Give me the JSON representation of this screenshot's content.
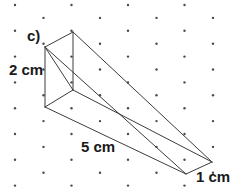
{
  "figure": {
    "kind": "isometric-dot-grid-wedge-prism",
    "labels": {
      "part": "c)",
      "height": "2 cm",
      "length": "5 cm",
      "depth": "1 cm"
    },
    "colors": {
      "line": "#3c3c3c",
      "dot": "#4a4a4a",
      "background": "#ffffff",
      "text": "#1a1a1a"
    },
    "grid": {
      "type": "isometric-staggered",
      "dot_radius": 1.2,
      "row_spacing": 12.9,
      "col_spacing": 56.5,
      "even_row_x_start": 15,
      "odd_row_x_start": 43.5,
      "rows": 15,
      "cols": 5
    },
    "vertices": {
      "front_top_left": [
        45,
        47
      ],
      "front_bottom_left": [
        45,
        107
      ],
      "back_top": [
        73,
        32
      ],
      "back_bottom": [
        73,
        90
      ],
      "right_upper_tip": [
        212,
        162
      ],
      "right_lower_tip": [
        186,
        174
      ]
    },
    "edges": [
      {
        "name": "front-left-vertical",
        "from": [
          45,
          47
        ],
        "to": [
          45,
          107
        ]
      },
      {
        "name": "back-vertical",
        "from": [
          73,
          32
        ],
        "to": [
          73,
          90
        ]
      },
      {
        "name": "top-left-diagonal",
        "from": [
          45,
          47
        ],
        "to": [
          73,
          32
        ]
      },
      {
        "name": "bottom-left-diagonal",
        "from": [
          45,
          107
        ],
        "to": [
          73,
          90
        ]
      },
      {
        "name": "front-face-diagonal",
        "from": [
          45,
          47
        ],
        "to": [
          73,
          90
        ]
      },
      {
        "name": "top-long-edge",
        "from": [
          73,
          32
        ],
        "to": [
          212,
          162
        ]
      },
      {
        "name": "front-top-long-edge",
        "from": [
          45,
          47
        ],
        "to": [
          186,
          174
        ]
      },
      {
        "name": "mid-long-edge",
        "from": [
          73,
          90
        ],
        "to": [
          212,
          162
        ]
      },
      {
        "name": "bottom-long-edge",
        "from": [
          45,
          107
        ],
        "to": [
          186,
          174
        ]
      },
      {
        "name": "right-end-edge",
        "from": [
          212,
          162
        ],
        "to": [
          186,
          174
        ]
      }
    ]
  }
}
